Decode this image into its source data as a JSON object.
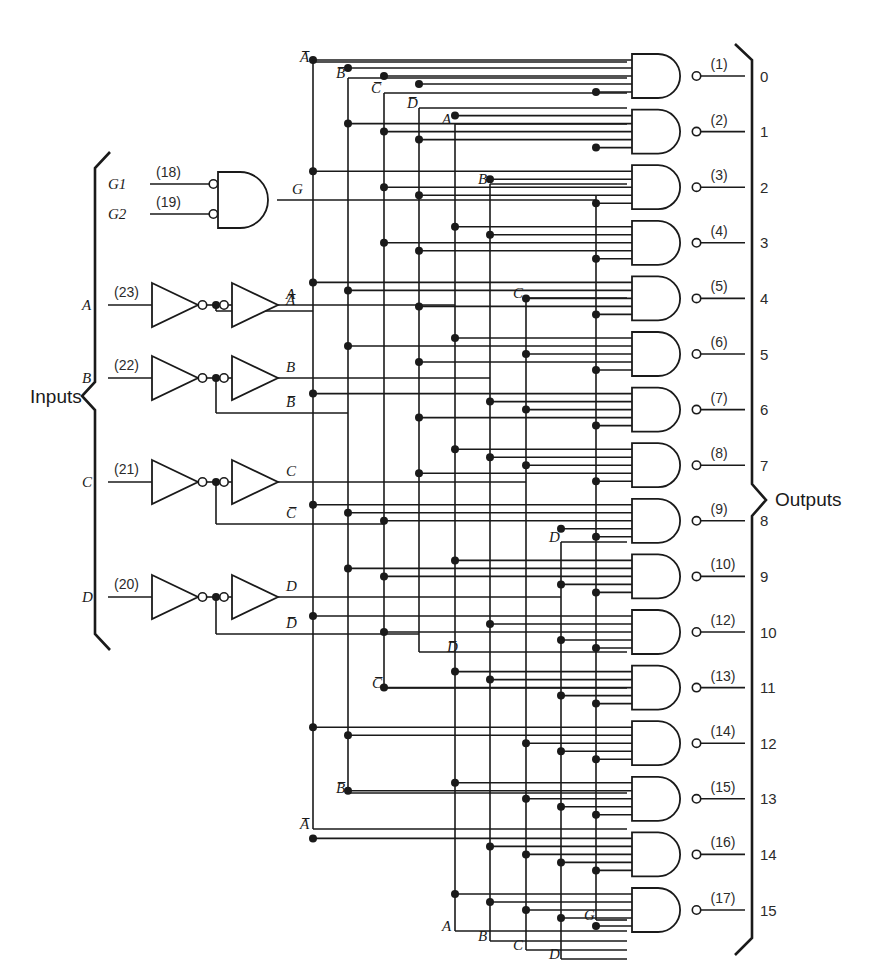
{
  "figure": {
    "inputs_label": "Inputs",
    "outputs_label": "Outputs"
  },
  "colors": {
    "line": "#1a1a1a",
    "text": "#1a1a1a",
    "background": "#ffffff"
  },
  "enable": {
    "gate_type": "nand",
    "inputs": [
      {
        "name": "G1",
        "pin": "(18)"
      },
      {
        "name": "G2",
        "pin": "(19)"
      }
    ],
    "output_label": "G"
  },
  "buffers": [
    {
      "input": "A",
      "pin": "(23)",
      "true_label": "A",
      "comp_label": "A̅"
    },
    {
      "input": "B",
      "pin": "(22)",
      "true_label": "B",
      "comp_label": "B̅"
    },
    {
      "input": "C",
      "pin": "(21)",
      "true_label": "C",
      "comp_label": "C̅"
    },
    {
      "input": "D",
      "pin": "(20)",
      "true_label": "D",
      "comp_label": "D̅"
    }
  ],
  "bus_labels_top": [
    {
      "label": "A̅",
      "x": 300,
      "y": 62
    },
    {
      "label": "B̅",
      "x": 336,
      "y": 78
    },
    {
      "label": "C̅",
      "x": 371,
      "y": 93
    },
    {
      "label": "D̅",
      "x": 407,
      "y": 108
    },
    {
      "label": "A",
      "x": 442,
      "y": 124
    },
    {
      "label": "B",
      "x": 478,
      "y": 184
    },
    {
      "label": "C",
      "x": 513,
      "y": 298
    },
    {
      "label": "D",
      "x": 549,
      "y": 542
    }
  ],
  "bus_labels_bottom": [
    {
      "label": "D̅",
      "x": 447,
      "y": 652
    },
    {
      "label": "C̅",
      "x": 372,
      "y": 688
    },
    {
      "label": "B̅",
      "x": 336,
      "y": 793
    },
    {
      "label": "A̅",
      "x": 300,
      "y": 829
    },
    {
      "label": "A",
      "x": 442,
      "y": 931
    },
    {
      "label": "B",
      "x": 478,
      "y": 941
    },
    {
      "label": "C",
      "x": 513,
      "y": 950
    },
    {
      "label": "D",
      "x": 549,
      "y": 959
    },
    {
      "label": "G",
      "x": 584,
      "y": 920
    }
  ],
  "outputs": [
    {
      "index": 0,
      "pin": "(1)",
      "number": "0"
    },
    {
      "index": 1,
      "pin": "(2)",
      "number": "1"
    },
    {
      "index": 2,
      "pin": "(3)",
      "number": "2"
    },
    {
      "index": 3,
      "pin": "(4)",
      "number": "3"
    },
    {
      "index": 4,
      "pin": "(5)",
      "number": "4"
    },
    {
      "index": 5,
      "pin": "(6)",
      "number": "5"
    },
    {
      "index": 6,
      "pin": "(7)",
      "number": "6"
    },
    {
      "index": 7,
      "pin": "(8)",
      "number": "7"
    },
    {
      "index": 8,
      "pin": "(9)",
      "number": "8"
    },
    {
      "index": 9,
      "pin": "(10)",
      "number": "9"
    },
    {
      "index": 10,
      "pin": "(12)",
      "number": "10"
    },
    {
      "index": 11,
      "pin": "(13)",
      "number": "11"
    },
    {
      "index": 12,
      "pin": "(14)",
      "number": "12"
    },
    {
      "index": 13,
      "pin": "(15)",
      "number": "13"
    },
    {
      "index": 14,
      "pin": "(16)",
      "number": "14"
    },
    {
      "index": 15,
      "pin": "(17)",
      "number": "15"
    }
  ],
  "geometry": {
    "gate_first_top": 54,
    "gate_pitch": 55.6,
    "gate_height": 44,
    "gate_left": 632,
    "gate_right": 690,
    "bus_x": {
      "Anot": 313,
      "Bnot": 348,
      "Cnot": 384,
      "Dnot": 419,
      "A": 455,
      "B": 490,
      "C": 526,
      "D": 561,
      "G": 596
    },
    "input_line_gap": 8
  },
  "chart_data": {
    "type": "table",
    "note": "Each output NAND gate receives 5 inputs: G plus one of each A/B/C/D variable (true or complemented).",
    "columns": [
      "output",
      "pin",
      "D",
      "C",
      "B",
      "A",
      "G"
    ],
    "rows": [
      [
        "0",
        "(1)",
        "D̅",
        "C̅",
        "B̅",
        "A̅",
        "G"
      ],
      [
        "1",
        "(2)",
        "D̅",
        "C̅",
        "B̅",
        "A",
        "G"
      ],
      [
        "2",
        "(3)",
        "D̅",
        "C̅",
        "B",
        "A̅",
        "G"
      ],
      [
        "3",
        "(4)",
        "D̅",
        "C̅",
        "B",
        "A",
        "G"
      ],
      [
        "4",
        "(5)",
        "D̅",
        "C",
        "B̅",
        "A̅",
        "G"
      ],
      [
        "5",
        "(6)",
        "D̅",
        "C",
        "B̅",
        "A",
        "G"
      ],
      [
        "6",
        "(7)",
        "D̅",
        "C",
        "B",
        "A̅",
        "G"
      ],
      [
        "7",
        "(8)",
        "D̅",
        "C",
        "B",
        "A",
        "G"
      ],
      [
        "8",
        "(9)",
        "D",
        "C̅",
        "B̅",
        "A̅",
        "G"
      ],
      [
        "9",
        "(10)",
        "D",
        "C̅",
        "B̅",
        "A",
        "G"
      ],
      [
        "10",
        "(12)",
        "D",
        "C̅",
        "B",
        "A̅",
        "G"
      ],
      [
        "11",
        "(13)",
        "D",
        "C̅",
        "B",
        "A",
        "G"
      ],
      [
        "12",
        "(14)",
        "D",
        "C",
        "B̅",
        "A̅",
        "G"
      ],
      [
        "13",
        "(15)",
        "D",
        "C",
        "B̅",
        "A",
        "G"
      ],
      [
        "14",
        "(16)",
        "D",
        "C",
        "B",
        "A̅",
        "G"
      ],
      [
        "15",
        "(17)",
        "D",
        "C",
        "B",
        "A",
        "G"
      ]
    ]
  }
}
